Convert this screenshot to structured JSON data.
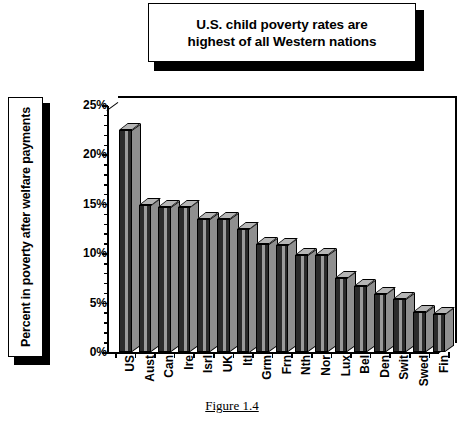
{
  "title": {
    "text": "U.S. child poverty rates are highest of all Western nations",
    "line1": "U.S. child poverty rates are",
    "line2": "highest of all Western nations"
  },
  "caption": "Figure 1.4",
  "axis": {
    "ylabel": "Percent in poverty after welfare payments",
    "yticks": [
      "0%",
      "5%",
      "10%",
      "15%",
      "20%",
      "25%"
    ]
  },
  "chart_data": {
    "type": "bar",
    "title": "U.S. child poverty rates are highest of all Western nations",
    "xlabel": "",
    "ylabel": "Percent in poverty after welfare payments",
    "ylim": [
      0,
      25
    ],
    "ytick_values": [
      0,
      5,
      10,
      15,
      20,
      25
    ],
    "ytick_labels": [
      "0%",
      "5%",
      "10%",
      "15%",
      "20%",
      "25%"
    ],
    "grid": false,
    "legend": "none",
    "style": "3d-column",
    "categories": [
      "US",
      "Aust",
      "Can",
      "Ire",
      "Isrl",
      "UK",
      "Itl",
      "Grm",
      "Frn",
      "Nth",
      "Nor",
      "Lux",
      "Bel",
      "Den",
      "Swit",
      "Swed",
      "Fin"
    ],
    "values": [
      22.5,
      14.9,
      14.7,
      14.7,
      13.5,
      13.5,
      12.5,
      10.9,
      10.8,
      9.8,
      9.8,
      7.5,
      6.7,
      5.9,
      5.4,
      4.0,
      3.8
    ]
  }
}
